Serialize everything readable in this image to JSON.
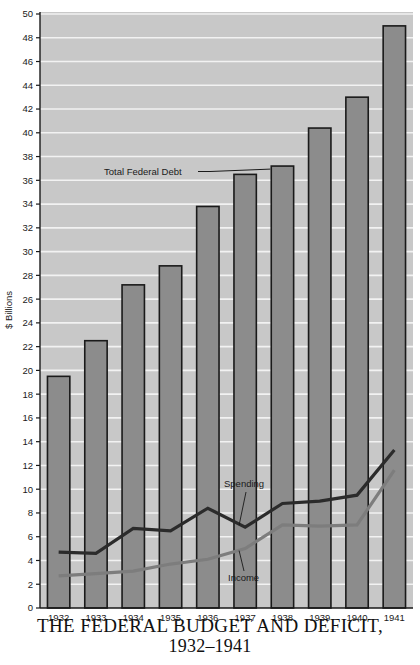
{
  "chart_data": {
    "type": "bar",
    "title": "THE FEDERAL BUDGET AND DEFICIT,",
    "subtitle": "1932–1941",
    "xlabel": "",
    "ylabel": "$ Billions",
    "categories": [
      "1932",
      "1933",
      "1934",
      "1935",
      "1936",
      "1937",
      "1938",
      "1939",
      "1940",
      "1941"
    ],
    "ylim": [
      0,
      50
    ],
    "ytick_step": 2,
    "ytick_labels": [
      "0",
      "2",
      "4",
      "6",
      "8",
      "10",
      "12",
      "14",
      "16",
      "18",
      "20",
      "22",
      "24",
      "26",
      "28",
      "30",
      "32",
      "34",
      "36",
      "38",
      "40",
      "42",
      "44",
      "46",
      "48",
      "50"
    ],
    "grid": true,
    "legend_position": "inline-annotations",
    "bars": {
      "name": "Total Federal Debt",
      "values": [
        19.5,
        22.5,
        27.2,
        28.8,
        33.8,
        36.5,
        37.2,
        40.4,
        43.0,
        49.0
      ],
      "color": "#8c8c8c",
      "edge_color": "#1a1a1a"
    },
    "series": [
      {
        "name": "Spending",
        "type": "line",
        "values": [
          4.7,
          4.6,
          6.7,
          6.5,
          8.4,
          6.8,
          8.8,
          9.0,
          9.5,
          13.3
        ],
        "color": "#2b2b2b"
      },
      {
        "name": "Income",
        "type": "line",
        "values": [
          2.7,
          2.9,
          3.1,
          3.7,
          4.1,
          5.0,
          7.0,
          6.9,
          7.0,
          11.6
        ],
        "color": "#7d7d7d"
      }
    ],
    "annotations": [
      {
        "label": "Total Federal Debt",
        "target_series": "bars",
        "target_category": "1938"
      },
      {
        "label": "Spending",
        "target_series": "Spending",
        "target_category": "1937"
      },
      {
        "label": "Income",
        "target_series": "Income",
        "target_category": "1937"
      }
    ],
    "colors": {
      "plot_background": "#c8c8c8",
      "gridline": "#f2f2f2",
      "bar_fill": "#8c8c8c",
      "bar_edge": "#1a1a1a",
      "spending_line": "#2b2b2b",
      "income_line": "#7d7d7d",
      "axis": "#1a1a1a",
      "text": "#1a1a1a",
      "page_background": "#ffffff"
    }
  }
}
